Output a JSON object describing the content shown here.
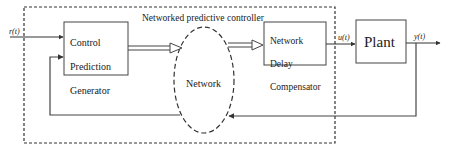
{
  "diagram": {
    "title": "Networked predictive controller",
    "signals": {
      "reference": "r(t)",
      "control": "u(t)",
      "output": "y(t)"
    },
    "blocks": {
      "cpg": {
        "line1": "Control",
        "line2": "Prediction",
        "line3": "Generator"
      },
      "network": {
        "label": "Network"
      },
      "ndc": {
        "line1": "Network",
        "line2": "Delay",
        "line3": "Compensator"
      },
      "plant": {
        "label": "Plant"
      }
    },
    "colors": {
      "line": "#333333",
      "dashed": "#333333",
      "background": "#ffffff"
    }
  }
}
